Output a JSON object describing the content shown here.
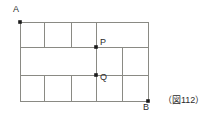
{
  "figure": {
    "caption": "（図112）",
    "stroke_color": "#8a8a84",
    "dot_color": "#1c1c1c",
    "text_color": "#2b2b2b",
    "background_color": "#ffffff",
    "outer_rect": {
      "x1": 20,
      "y1": 22,
      "x2": 148,
      "y2": 101
    },
    "points": [
      {
        "name": "A",
        "label": "A",
        "x": 20,
        "y": 22
      },
      {
        "name": "B",
        "label": "B",
        "x": 148,
        "y": 101
      },
      {
        "name": "P",
        "label": "P",
        "x": 96,
        "y": 47
      },
      {
        "name": "Q",
        "label": "Q",
        "x": 96,
        "y": 75
      }
    ],
    "horizontal_lines": [
      {
        "name": "top-edge",
        "y": 22,
        "x1": 20,
        "x2": 148
      },
      {
        "name": "upper-divider",
        "y": 47,
        "x1": 20,
        "x2": 148
      },
      {
        "name": "lower-divider",
        "y": 75,
        "x1": 20,
        "x2": 148
      },
      {
        "name": "bottom-edge",
        "y": 101,
        "x1": 20,
        "x2": 148
      }
    ],
    "vertical_lines": [
      {
        "name": "left-edge",
        "x": 20,
        "y1": 22,
        "y2": 101
      },
      {
        "name": "right-edge",
        "x": 148,
        "y1": 22,
        "y2": 101
      },
      {
        "name": "top-row-div-1",
        "x": 44,
        "y1": 22,
        "y2": 47
      },
      {
        "name": "top-row-div-2",
        "x": 71,
        "y1": 22,
        "y2": 47
      },
      {
        "name": "pq-segment",
        "x": 96,
        "y1": 22,
        "y2": 101
      },
      {
        "name": "mid-row-div",
        "x": 122,
        "y1": 47,
        "y2": 101
      },
      {
        "name": "bottom-row-div-1",
        "x": 44,
        "y1": 75,
        "y2": 101
      },
      {
        "name": "bottom-row-div-2",
        "x": 71,
        "y1": 75,
        "y2": 101
      }
    ]
  }
}
